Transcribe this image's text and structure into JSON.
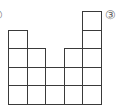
{
  "figure": {
    "type": "square-grid-shape",
    "labels": {
      "left": "②",
      "right": "③"
    },
    "grid": {
      "origin_x": 8,
      "bottom_y": 104,
      "cell_size": 18.6,
      "column_heights": [
        4,
        3,
        2,
        3,
        5
      ],
      "line_color": "#3a3a3a"
    },
    "total_squares": 17
  }
}
